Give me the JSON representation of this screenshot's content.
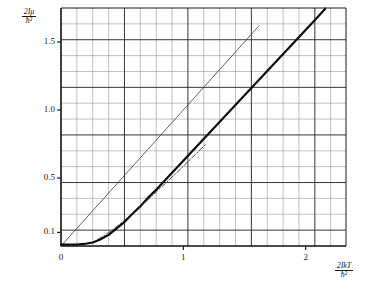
{
  "chart_data": {
    "type": "line",
    "title": "",
    "subtitle": "",
    "xlabel": "2IkT/h̄²",
    "ylabel": "2Iμ/h̄²",
    "xlabel_numerator": "2IkT",
    "xlabel_denominator": "ħ²",
    "ylabel_numerator": "2Iμ",
    "ylabel_denominator": "ħ²",
    "xlim": [
      0,
      2.33
    ],
    "ylim": [
      0,
      1.75
    ],
    "grid": true,
    "grid_minor": true,
    "legend": "none",
    "xticks": [
      0,
      1,
      2
    ],
    "xtick_labels": [
      "0",
      "1",
      "2"
    ],
    "yticks": [
      0.1,
      0.5,
      1.0,
      1.5
    ],
    "ytick_labels": [
      "0.1",
      "0.5",
      "1.0",
      "1.5"
    ],
    "x_minor_step": 0.1297,
    "y_minor_step": 0.11667,
    "x_major_every": 4,
    "y_major_every": 3,
    "series": [
      {
        "name": "classical-asymptote",
        "style": "solid-thin",
        "color": "#3a3a3a",
        "width": 0.8,
        "comment": "straight classical line",
        "x": [
          0.0,
          0.13,
          0.26,
          0.39,
          0.52,
          0.65,
          0.78,
          0.91,
          1.04,
          1.17,
          1.3,
          1.43,
          1.56,
          1.62
        ],
        "y": [
          0.0,
          0.13,
          0.26,
          0.39,
          0.52,
          0.65,
          0.78,
          0.91,
          1.04,
          1.17,
          1.3,
          1.43,
          1.56,
          1.62
        ]
      },
      {
        "name": "exact-quantum-curve",
        "style": "solid-thick",
        "color": "#0d0d0d",
        "width": 2.2,
        "comment": "exact result, flat at low T then linear",
        "x": [
          0.0,
          0.06,
          0.13,
          0.19,
          0.26,
          0.32,
          0.39,
          0.45,
          0.52,
          0.58,
          0.65,
          0.71,
          0.78,
          0.91,
          1.04,
          1.17,
          1.3,
          1.43,
          1.56,
          1.69,
          1.82,
          1.95,
          2.08,
          2.16
        ],
        "y": [
          0.01,
          0.01,
          0.011,
          0.015,
          0.026,
          0.048,
          0.082,
          0.126,
          0.178,
          0.234,
          0.293,
          0.354,
          0.416,
          0.541,
          0.666,
          0.791,
          0.916,
          1.041,
          1.166,
          1.291,
          1.416,
          1.541,
          1.666,
          1.745
        ]
      },
      {
        "name": "approximation-curve",
        "style": "dash-dot",
        "color": "#2a2a2a",
        "width": 0.9,
        "comment": "intermediate approximation merging into exact curve",
        "x": [
          0.3,
          0.36,
          0.42,
          0.48,
          0.55,
          0.62,
          0.7,
          0.78,
          0.86,
          0.94,
          1.02,
          1.1,
          1.18
        ],
        "y": [
          0.048,
          0.08,
          0.118,
          0.16,
          0.212,
          0.268,
          0.332,
          0.398,
          0.466,
          0.534,
          0.604,
          0.674,
          0.746
        ]
      }
    ]
  },
  "axes": {
    "origin_label": "0"
  }
}
